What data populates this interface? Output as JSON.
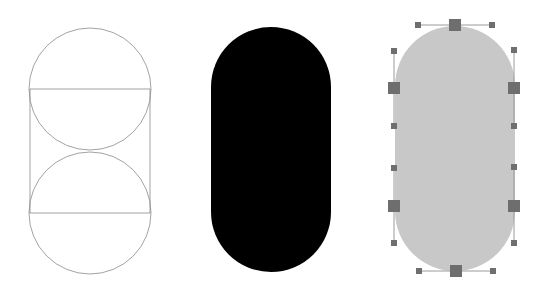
{
  "colors": {
    "background": "#ffffff",
    "construction_stroke": "#8a8a8a",
    "solid_fill": "#000000",
    "selected_fill": "#c8c8c8",
    "anchor_fill": "#6e6e6e",
    "handle_fill": "#6e6e6e",
    "handle_line": "#9a9a9a"
  },
  "figures": [
    {
      "id": "construction",
      "description": "Two stacked circles with a bounding rectangle (stadium construction)",
      "cx": 90,
      "r": 61,
      "top_circle_cy": 89,
      "bottom_circle_cy": 213,
      "rect": {
        "x": 30,
        "y": 89,
        "w": 120,
        "h": 124
      }
    },
    {
      "id": "filled-stadium",
      "description": "Black filled stadium shape",
      "x": 211,
      "y": 27,
      "w": 120,
      "h": 245
    },
    {
      "id": "selected-stadium",
      "description": "Gray stadium shape selected with bezier anchors and handles",
      "x": 395,
      "y": 26,
      "w": 120,
      "h": 245,
      "anchors": [
        {
          "x": 455,
          "y": 25
        },
        {
          "x": 514,
          "y": 88
        },
        {
          "x": 514,
          "y": 206
        },
        {
          "x": 456,
          "y": 271
        },
        {
          "x": 394,
          "y": 206
        },
        {
          "x": 394,
          "y": 88
        }
      ],
      "handles": [
        {
          "from": [
            455,
            25
          ],
          "to": [
            418,
            25
          ]
        },
        {
          "from": [
            455,
            25
          ],
          "to": [
            492,
            25
          ]
        },
        {
          "from": [
            514,
            88
          ],
          "to": [
            514,
            50
          ]
        },
        {
          "from": [
            514,
            88
          ],
          "to": [
            514,
            126
          ]
        },
        {
          "from": [
            514,
            206
          ],
          "to": [
            514,
            167
          ]
        },
        {
          "from": [
            514,
            206
          ],
          "to": [
            514,
            243
          ]
        },
        {
          "from": [
            456,
            271
          ],
          "to": [
            419,
            271
          ]
        },
        {
          "from": [
            456,
            271
          ],
          "to": [
            493,
            271
          ]
        },
        {
          "from": [
            394,
            206
          ],
          "to": [
            394,
            168
          ]
        },
        {
          "from": [
            394,
            206
          ],
          "to": [
            394,
            243
          ]
        },
        {
          "from": [
            394,
            88
          ],
          "to": [
            394,
            51
          ]
        },
        {
          "from": [
            394,
            88
          ],
          "to": [
            394,
            126
          ]
        }
      ]
    }
  ]
}
